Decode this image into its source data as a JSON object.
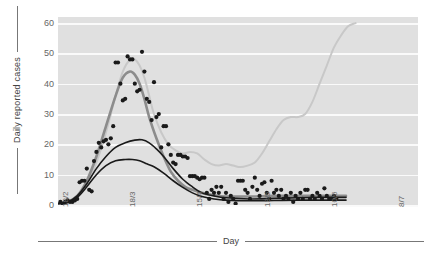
{
  "chart_data": {
    "type": "line",
    "title": "",
    "xlabel": "Day",
    "ylabel": "Daily reported cases",
    "ylim": [
      0,
      62
    ],
    "yticks": [
      0,
      10,
      20,
      30,
      40,
      50,
      60
    ],
    "xticks": [
      "18/2",
      "18/3",
      "15/4",
      "13/5",
      "10/6",
      "8/7"
    ],
    "xtick_positions": [
      0,
      28,
      56,
      84,
      112,
      140
    ],
    "xlim": [
      0,
      150
    ],
    "grid": "horizontal-white",
    "legend": "none",
    "plot_background": "#e0e0e0",
    "series": [
      {
        "name": "scatter-observed",
        "type": "scatter",
        "color": "#1a1a1a",
        "points": [
          [
            1,
            1
          ],
          [
            2,
            0.5
          ],
          [
            3,
            1
          ],
          [
            4,
            1.5
          ],
          [
            5,
            1
          ],
          [
            6,
            1
          ],
          [
            7,
            1.5
          ],
          [
            8,
            2
          ],
          [
            9,
            7.5
          ],
          [
            10,
            8
          ],
          [
            11,
            8
          ],
          [
            12,
            12
          ],
          [
            13,
            5
          ],
          [
            14,
            4.5
          ],
          [
            15,
            14.5
          ],
          [
            16,
            17.5
          ],
          [
            17,
            20.5
          ],
          [
            18,
            19
          ],
          [
            19,
            21
          ],
          [
            20,
            21.5
          ],
          [
            21,
            20
          ],
          [
            22,
            22
          ],
          [
            23,
            26
          ],
          [
            24,
            47
          ],
          [
            25,
            47
          ],
          [
            26,
            40
          ],
          [
            27,
            34.5
          ],
          [
            28,
            35
          ],
          [
            29,
            49
          ],
          [
            30,
            48
          ],
          [
            31,
            48
          ],
          [
            32,
            40
          ],
          [
            33,
            37.5
          ],
          [
            34,
            38
          ],
          [
            35,
            50.5
          ],
          [
            36,
            44
          ],
          [
            37,
            35
          ],
          [
            38,
            34
          ],
          [
            39,
            28
          ],
          [
            40,
            40.5
          ],
          [
            41,
            29
          ],
          [
            42,
            30
          ],
          [
            43,
            19
          ],
          [
            44,
            26
          ],
          [
            45,
            26
          ],
          [
            46,
            20
          ],
          [
            47,
            16.5
          ],
          [
            48,
            14
          ],
          [
            49,
            13.5
          ],
          [
            50,
            16.5
          ],
          [
            51,
            16.5
          ],
          [
            52,
            16
          ],
          [
            53,
            16
          ],
          [
            54,
            15.5
          ],
          [
            55,
            9.5
          ],
          [
            56,
            9.5
          ],
          [
            57,
            9.5
          ],
          [
            58,
            9
          ],
          [
            59,
            8.5
          ],
          [
            60,
            9
          ],
          [
            61,
            9
          ],
          [
            62,
            4
          ],
          [
            63,
            2
          ],
          [
            64,
            5
          ],
          [
            65,
            4
          ],
          [
            66,
            6
          ],
          [
            67,
            4
          ],
          [
            68,
            6
          ],
          [
            69,
            2
          ],
          [
            70,
            4
          ],
          [
            71,
            1
          ],
          [
            72,
            3
          ],
          [
            73,
            2
          ],
          [
            74,
            0.5
          ],
          [
            75,
            8
          ],
          [
            76,
            8
          ],
          [
            77,
            8
          ],
          [
            78,
            5
          ],
          [
            79,
            4
          ],
          [
            80,
            2
          ],
          [
            81,
            6
          ],
          [
            82,
            9
          ],
          [
            83,
            5
          ],
          [
            84,
            3
          ],
          [
            85,
            7
          ],
          [
            86,
            7.5
          ],
          [
            87,
            4
          ],
          [
            88,
            2
          ],
          [
            89,
            8
          ],
          [
            90,
            4
          ],
          [
            91,
            5
          ],
          [
            92,
            3
          ],
          [
            93,
            5
          ],
          [
            94,
            2
          ],
          [
            95,
            3
          ],
          [
            96,
            2
          ],
          [
            97,
            4
          ],
          [
            98,
            1
          ],
          [
            99,
            3
          ],
          [
            100,
            2
          ],
          [
            101,
            4
          ],
          [
            102,
            2
          ],
          [
            103,
            5
          ],
          [
            104,
            5
          ],
          [
            105,
            2
          ],
          [
            106,
            3
          ],
          [
            107,
            2
          ],
          [
            108,
            4
          ],
          [
            109,
            3
          ],
          [
            110,
            2
          ],
          [
            111,
            5.5
          ],
          [
            112,
            3
          ],
          [
            113,
            2
          ],
          [
            114,
            2
          ],
          [
            115,
            3
          ],
          [
            116,
            2
          ]
        ]
      },
      {
        "name": "model-light-gray",
        "type": "line",
        "color": "#c8c8c8",
        "width": 2,
        "description": "peaks ~48 near day 31, declines to trough ~12.5 around day 80, then rises steeply to ~60 at right edge",
        "values": [
          [
            0,
            0.6
          ],
          [
            4,
            1.2
          ],
          [
            8,
            3
          ],
          [
            12,
            7
          ],
          [
            16,
            14
          ],
          [
            20,
            24
          ],
          [
            24,
            36
          ],
          [
            27,
            44
          ],
          [
            30,
            48
          ],
          [
            32,
            48
          ],
          [
            34,
            46
          ],
          [
            36,
            42
          ],
          [
            38,
            36
          ],
          [
            40,
            30
          ],
          [
            43,
            24
          ],
          [
            46,
            20
          ],
          [
            49,
            18
          ],
          [
            52,
            17
          ],
          [
            55,
            17.5
          ],
          [
            58,
            17
          ],
          [
            61,
            15
          ],
          [
            64,
            13.5
          ],
          [
            67,
            13
          ],
          [
            70,
            13.5
          ],
          [
            73,
            13
          ],
          [
            76,
            12.5
          ],
          [
            79,
            13
          ],
          [
            82,
            14
          ],
          [
            85,
            17
          ],
          [
            88,
            21
          ],
          [
            91,
            25
          ],
          [
            94,
            28
          ],
          [
            97,
            29
          ],
          [
            100,
            29
          ],
          [
            103,
            30
          ],
          [
            106,
            34
          ],
          [
            109,
            40
          ],
          [
            112,
            46
          ],
          [
            115,
            52
          ],
          [
            118,
            56
          ],
          [
            121,
            59
          ],
          [
            124,
            60
          ]
        ]
      },
      {
        "name": "model-medium-gray",
        "type": "line",
        "color": "#8c8c8c",
        "width": 2.6,
        "description": "peaks ~44 near day 30, falls to ~3 and remains flat",
        "values": [
          [
            0,
            0.5
          ],
          [
            4,
            1
          ],
          [
            8,
            3
          ],
          [
            12,
            8
          ],
          [
            16,
            16
          ],
          [
            20,
            26
          ],
          [
            24,
            36
          ],
          [
            27,
            42
          ],
          [
            30,
            44
          ],
          [
            32,
            43
          ],
          [
            34,
            40
          ],
          [
            36,
            35
          ],
          [
            38,
            29
          ],
          [
            41,
            22
          ],
          [
            44,
            16
          ],
          [
            47,
            11
          ],
          [
            50,
            8
          ],
          [
            53,
            6
          ],
          [
            56,
            5
          ],
          [
            60,
            4
          ],
          [
            65,
            3.2
          ],
          [
            70,
            2.8
          ],
          [
            80,
            2.8
          ],
          [
            90,
            3
          ],
          [
            100,
            3
          ],
          [
            110,
            3
          ],
          [
            120,
            3
          ]
        ]
      },
      {
        "name": "model-black-upper",
        "type": "line",
        "color": "#1a1a1a",
        "width": 1.6,
        "description": "peaks ~21.5 near day 33, long slow decline to ~2",
        "values": [
          [
            0,
            0.5
          ],
          [
            4,
            1
          ],
          [
            8,
            3
          ],
          [
            12,
            7
          ],
          [
            16,
            12
          ],
          [
            20,
            16
          ],
          [
            24,
            19
          ],
          [
            28,
            20.5
          ],
          [
            32,
            21.4
          ],
          [
            35,
            21.5
          ],
          [
            38,
            20.5
          ],
          [
            41,
            18.5
          ],
          [
            44,
            16
          ],
          [
            48,
            12
          ],
          [
            52,
            8.5
          ],
          [
            56,
            6
          ],
          [
            60,
            4
          ],
          [
            65,
            3
          ],
          [
            70,
            2.4
          ],
          [
            80,
            2
          ],
          [
            90,
            2.2
          ],
          [
            100,
            2.4
          ],
          [
            110,
            2.5
          ],
          [
            120,
            2.5
          ]
        ]
      },
      {
        "name": "model-black-lower",
        "type": "line",
        "color": "#1a1a1a",
        "width": 1.6,
        "description": "peaks ~15 near day 31, decays to ~1.5",
        "values": [
          [
            0,
            0.4
          ],
          [
            4,
            0.8
          ],
          [
            8,
            2.5
          ],
          [
            12,
            6
          ],
          [
            16,
            10
          ],
          [
            20,
            13
          ],
          [
            24,
            14.6
          ],
          [
            28,
            15
          ],
          [
            31,
            15
          ],
          [
            34,
            14.6
          ],
          [
            37,
            13.6
          ],
          [
            40,
            12.6
          ],
          [
            44,
            10.5
          ],
          [
            48,
            8
          ],
          [
            52,
            5.8
          ],
          [
            56,
            4
          ],
          [
            60,
            2.8
          ],
          [
            65,
            2
          ],
          [
            70,
            1.6
          ],
          [
            80,
            1.4
          ],
          [
            90,
            1.5
          ],
          [
            100,
            1.6
          ],
          [
            110,
            1.6
          ],
          [
            120,
            1.6
          ]
        ]
      }
    ]
  },
  "axis": {
    "y_title": "Daily reported cases",
    "x_title": "Day"
  }
}
